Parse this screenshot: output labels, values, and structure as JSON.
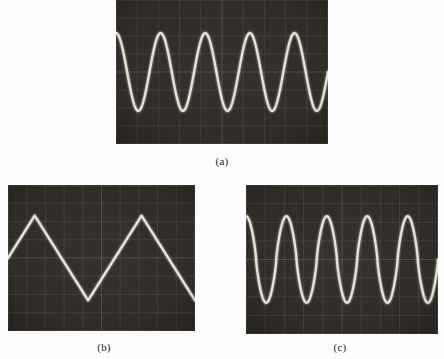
{
  "figure": {
    "background_color": "#fefefe",
    "panel_count": 3
  },
  "panels": [
    {
      "id": "panel-a",
      "caption": "(a)",
      "waveform": "sine",
      "screen_color": "#2e2a26",
      "trace_color": "#f2efe6",
      "graticule_color": "#6e6a60",
      "rect": {
        "x": 116,
        "y": 0,
        "w": 212,
        "h": 144
      },
      "caption_pos": {
        "x": 222,
        "y": 155
      },
      "grid": {
        "cols": 10,
        "rows": 8
      },
      "cycles": 4.75,
      "amplitude_frac": 0.27,
      "center_frac": 0.5,
      "phase_deg": 90
    },
    {
      "id": "panel-b",
      "caption": "(b)",
      "waveform": "triangle",
      "screen_color": "#2e2a26",
      "trace_color": "#f4f1e8",
      "graticule_color": "#6e6a60",
      "rect": {
        "x": 8,
        "y": 185,
        "w": 187,
        "h": 146
      },
      "caption_pos": {
        "x": 104,
        "y": 341
      },
      "grid": {
        "cols": 10,
        "rows": 8
      },
      "cycles": 1.75,
      "amplitude_frac": 0.29,
      "center_frac": 0.5,
      "phase_deg": 90
    },
    {
      "id": "panel-c",
      "caption": "(c)",
      "waveform": "sine-peaked",
      "screen_color": "#2e2a26",
      "trace_color": "#f2efe6",
      "graticule_color": "#6e6a60",
      "rect": {
        "x": 246,
        "y": 185,
        "w": 192,
        "h": 149
      },
      "caption_pos": {
        "x": 340,
        "y": 341
      },
      "grid": {
        "cols": 10,
        "rows": 8
      },
      "cycles": 4.75,
      "amplitude_frac": 0.29,
      "center_frac": 0.5,
      "phase_deg": 90
    }
  ],
  "chart_data": {
    "type": "line",
    "title": "",
    "xlabel": "",
    "ylabel": "",
    "subplots": [
      {
        "label": "(a)",
        "waveform": "sine",
        "cycles_visible": 4.75,
        "peak_to_peak_divisions": 4.3,
        "divisions_per_cycle": 2.1,
        "horizontal_divisions": 10,
        "vertical_divisions": 8,
        "grid": true
      },
      {
        "label": "(b)",
        "waveform": "triangle",
        "cycles_visible": 1.75,
        "peak_to_peak_divisions": 4.6,
        "divisions_per_cycle": 5.7,
        "horizontal_divisions": 10,
        "vertical_divisions": 8,
        "grid": true
      },
      {
        "label": "(c)",
        "waveform": "sine with narrowed peaks",
        "cycles_visible": 4.75,
        "peak_to_peak_divisions": 4.6,
        "divisions_per_cycle": 2.1,
        "horizontal_divisions": 10,
        "vertical_divisions": 8,
        "grid": true
      }
    ]
  }
}
